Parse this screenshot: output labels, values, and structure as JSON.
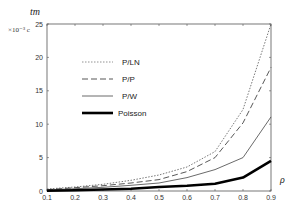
{
  "chart_data": {
    "type": "line",
    "title": "",
    "ylabel": "t_m",
    "ylabel_display": "tm",
    "y_multiplier": "×10⁻³ c",
    "xlabel": "ρ",
    "xlim": [
      0.1,
      0.9
    ],
    "ylim": [
      0,
      25
    ],
    "x_ticks": [
      "0.1",
      "0.2",
      "0.3",
      "0.4",
      "0.5",
      "0.6",
      "0.7",
      "0.8",
      "0.9"
    ],
    "y_ticks": [
      "0",
      "5",
      "10",
      "15",
      "20",
      "25"
    ],
    "grid": false,
    "legend_position": "top-left",
    "x": [
      0.1,
      0.2,
      0.3,
      0.4,
      0.5,
      0.6,
      0.7,
      0.8,
      0.9
    ],
    "series": [
      {
        "name": "P/LN",
        "style": "dotted",
        "values": [
          0.3,
          0.6,
          1.0,
          1.6,
          2.4,
          3.6,
          5.9,
          12.2,
          25.0
        ]
      },
      {
        "name": "P/P",
        "style": "dashed",
        "values": [
          0.2,
          0.5,
          0.8,
          1.2,
          1.7,
          2.9,
          5.0,
          10.2,
          18.5
        ]
      },
      {
        "name": "P/W",
        "style": "solid",
        "values": [
          0.15,
          0.35,
          0.55,
          0.85,
          1.2,
          2.0,
          3.2,
          5.0,
          11.1
        ]
      },
      {
        "name": "Poisson",
        "style": "thick",
        "values": [
          0.05,
          0.12,
          0.22,
          0.35,
          0.6,
          0.8,
          1.1,
          2.0,
          4.5
        ]
      }
    ]
  }
}
